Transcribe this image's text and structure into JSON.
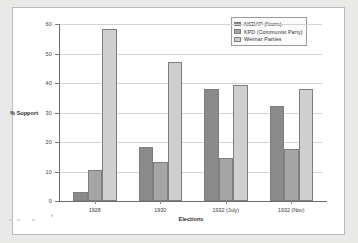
{
  "chart_data": {
    "type": "bar",
    "title": "",
    "xlabel": "Elections",
    "ylabel": "% Support",
    "ylim": [
      0,
      60
    ],
    "yticks": [
      0,
      10,
      20,
      30,
      40,
      50,
      60
    ],
    "grid": true,
    "legend_position": "top-right",
    "categories": [
      "1928",
      "1930",
      "1932 (July)",
      "1932 (Nov)"
    ],
    "series": [
      {
        "name": "NSDAP (Nazis)",
        "color": "#8a8a8a",
        "values": [
          3.0,
          18.3,
          37.9,
          32.3
        ]
      },
      {
        "name": "KPD (Communist Party)",
        "color": "#a5a5a5",
        "values": [
          10.6,
          13.1,
          14.6,
          17.7
        ]
      },
      {
        "name": "Weimar Parties",
        "color": "#cfcfcf",
        "values": [
          58.3,
          47.2,
          39.3,
          38.0
        ]
      }
    ]
  },
  "axis": {
    "y_tick_labels": [
      "0",
      "10",
      "20",
      "30",
      "40",
      "50",
      "60"
    ],
    "y_title": "% Support",
    "x_title": "Elections",
    "x_tick_labels": [
      "1928",
      "1930",
      "1932 (July)",
      "1932 (Nov)"
    ]
  },
  "legend": {
    "entries": [
      {
        "label": "NSDAP (Nazis)"
      },
      {
        "label": "KPD (Communist Party)"
      },
      {
        "label": "Weimar Parties"
      }
    ]
  }
}
